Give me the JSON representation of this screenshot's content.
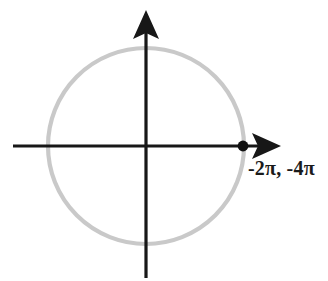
{
  "figure": {
    "background_color": "#ffffff",
    "width": 328,
    "height": 281
  },
  "axes": {
    "color": "#171717",
    "x_axis": {
      "name": "horizontal-axis",
      "start_x": 13,
      "end_x": 281,
      "y": 146,
      "arrow_direction": "right"
    },
    "y_axis": {
      "name": "vertical-axis",
      "x": 146,
      "start_y": 10,
      "end_y": 278,
      "arrow_direction": "up"
    }
  },
  "circle": {
    "name": "unit-circle",
    "center_x": 146,
    "center_y": 146,
    "radius": 98,
    "stroke_color": "#c9c9c9",
    "stroke_width": 4.2
  },
  "point": {
    "name": "marked-point",
    "x": 243,
    "y": 146,
    "radius": 5.4,
    "color": "#111111",
    "label": "-2π, -4π",
    "label_x": 248,
    "label_y": 175
  },
  "chart_data": {
    "type": "scatter",
    "xlabel": "",
    "ylabel": "",
    "xlim": [
      -1.35,
      1.35
    ],
    "ylim": [
      -1.35,
      1.35
    ],
    "grid": false,
    "legend": "none",
    "curves": [
      {
        "name": "unit circle",
        "shape": "circle",
        "center": [
          0,
          0
        ],
        "radius": 1,
        "color": "#c9c9c9"
      }
    ],
    "points": [
      {
        "x": 1,
        "y": 0,
        "label": "-2π, -4π",
        "color": "#111111"
      }
    ],
    "annotations": [
      "-2π, -4π"
    ]
  }
}
